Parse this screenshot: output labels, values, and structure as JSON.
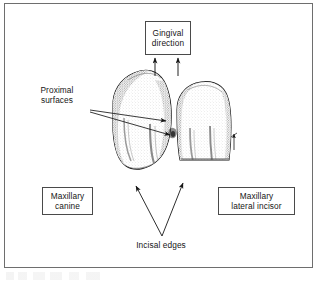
{
  "figure": {
    "type": "anatomical-line-drawing",
    "frame_color": "#6e6e6e",
    "ink_color": "#161616",
    "background": "#ffffff"
  },
  "callouts": {
    "gingival": {
      "name": "gingival-direction",
      "boxed": true,
      "line1": "Gingival",
      "line2": "direction"
    },
    "canine": {
      "name": "maxillary-canine",
      "boxed": true,
      "line1": "Maxillary",
      "line2": "canine"
    },
    "lateral_incisor": {
      "name": "maxillary-lateral-incisor",
      "boxed": true,
      "line1": "Maxillary",
      "line2": "lateral incisor"
    },
    "proximal": {
      "name": "proximal-surfaces",
      "boxed": false,
      "line1": "Proximal",
      "line2": "surfaces"
    },
    "incisal": {
      "name": "incisal-edges",
      "boxed": false,
      "line1": "Incisal edges",
      "line2": ""
    }
  },
  "annotations": {
    "gingival_arrows": 2,
    "proximal_arrows": 2,
    "incisal_arrows": 2,
    "contact_marker_arrows": 1
  },
  "teeth": [
    {
      "name": "maxillary-canine",
      "position": "left",
      "shape": "rounded-ovoid-with-cusp"
    },
    {
      "name": "maxillary-lateral-incisor",
      "position": "right",
      "shape": "rounded-rectangular-crown"
    }
  ]
}
